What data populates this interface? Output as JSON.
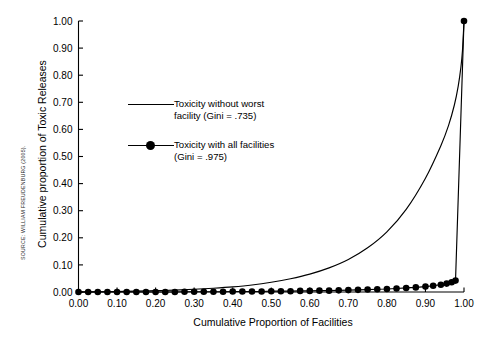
{
  "figure": {
    "source_note": "SOURCE: WILLIAM FREUDENBURG (2005).",
    "background_color": "#ffffff",
    "ink_color": "#000000"
  },
  "legend": {
    "position": "inside-upper-left",
    "entries": [
      {
        "name": "legend-entry-without-worst",
        "line1": "Toxicity without worst",
        "line2": "facility (Gini = .735)",
        "sample": "line",
        "gini": ".735"
      },
      {
        "name": "legend-entry-all-facilities",
        "line1": "Toxicity with all facilities",
        "line2": " (Gini = .975)",
        "sample": "line-with-marker",
        "gini": ".975"
      }
    ]
  },
  "chart_data": {
    "type": "line",
    "title": "",
    "subtitle": "",
    "xlabel": "Cumulative Proportion of Facilities",
    "ylabel": "Cumulative proportion of Toxic Releases",
    "xlim": [
      0,
      1
    ],
    "ylim": [
      0,
      1
    ],
    "grid": false,
    "legend_position": "inside-upper-left",
    "xticks": [
      "0.00",
      "0.10",
      "0.20",
      "0.30",
      "0.40",
      "0.50",
      "0.60",
      "0.70",
      "0.80",
      "0.90",
      "1.00"
    ],
    "xtick_values": [
      0,
      0.1,
      0.2,
      0.3,
      0.4,
      0.5,
      0.6,
      0.7,
      0.8,
      0.9,
      1.0
    ],
    "yticks": [
      "0.00",
      "0.10",
      "0.20",
      "0.30",
      "0.40",
      "0.50",
      "0.60",
      "0.70",
      "0.80",
      "0.90",
      "1.00"
    ],
    "ytick_values": [
      0,
      0.1,
      0.2,
      0.3,
      0.4,
      0.5,
      0.6,
      0.7,
      0.8,
      0.9,
      1.0
    ],
    "series": [
      {
        "name": "Toxicity without worst facility (Gini = .735)",
        "style": "line",
        "marker": "none",
        "color": "#000000",
        "x": [
          0.0,
          0.05,
          0.1,
          0.15,
          0.2,
          0.25,
          0.3,
          0.35,
          0.4,
          0.45,
          0.5,
          0.55,
          0.6,
          0.65,
          0.7,
          0.75,
          0.8,
          0.85,
          0.9,
          0.94,
          0.96,
          0.975,
          0.985,
          0.992,
          0.996,
          1.0
        ],
        "y": [
          0.0,
          0.001,
          0.002,
          0.003,
          0.005,
          0.007,
          0.01,
          0.014,
          0.019,
          0.026,
          0.036,
          0.049,
          0.066,
          0.089,
          0.12,
          0.163,
          0.222,
          0.305,
          0.42,
          0.54,
          0.615,
          0.69,
          0.76,
          0.83,
          0.89,
          1.0
        ]
      },
      {
        "name": "Toxicity with all facilities (Gini = .975)",
        "style": "line",
        "marker": "filled-circle",
        "color": "#000000",
        "x": [
          0.0,
          0.025,
          0.05,
          0.075,
          0.1,
          0.125,
          0.15,
          0.175,
          0.2,
          0.225,
          0.25,
          0.275,
          0.3,
          0.325,
          0.35,
          0.375,
          0.4,
          0.425,
          0.45,
          0.475,
          0.5,
          0.525,
          0.55,
          0.575,
          0.6,
          0.625,
          0.65,
          0.675,
          0.7,
          0.725,
          0.75,
          0.775,
          0.8,
          0.825,
          0.85,
          0.875,
          0.9,
          0.92,
          0.94,
          0.955,
          0.968,
          0.978,
          1.0
        ],
        "y": [
          0.0,
          0.0,
          0.0,
          0.0,
          0.0,
          0.0,
          0.0,
          0.0,
          0.0,
          0.0,
          0.0,
          0.001,
          0.001,
          0.001,
          0.001,
          0.001,
          0.002,
          0.002,
          0.002,
          0.002,
          0.003,
          0.003,
          0.003,
          0.004,
          0.004,
          0.005,
          0.005,
          0.006,
          0.007,
          0.008,
          0.009,
          0.01,
          0.011,
          0.013,
          0.015,
          0.017,
          0.02,
          0.023,
          0.027,
          0.031,
          0.036,
          0.042,
          1.0
        ]
      }
    ]
  }
}
